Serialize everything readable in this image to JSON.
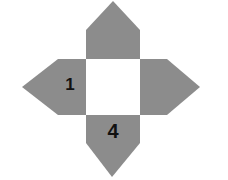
{
  "diagram": {
    "type": "cube-net-cross-with-pointed-arms",
    "colors": {
      "arm_fill": "#8c8c8c",
      "center_fill": "#ffffff",
      "label": "#111111"
    },
    "center_square": {
      "label": ""
    },
    "arms": [
      {
        "position": "top",
        "label": ""
      },
      {
        "position": "left",
        "label": "1"
      },
      {
        "position": "right",
        "label": ""
      },
      {
        "position": "bottom",
        "label": "4"
      }
    ]
  }
}
